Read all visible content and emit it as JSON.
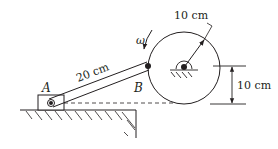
{
  "diagram": {
    "type": "mechanism",
    "labels": {
      "point_a": "A",
      "point_b": "B",
      "angular_velocity": "ω",
      "rod_length": "20 cm",
      "disc_radius": "10 cm",
      "center_height": "10 cm"
    },
    "colors": {
      "stroke": "#231f20",
      "background": "#ffffff"
    }
  }
}
